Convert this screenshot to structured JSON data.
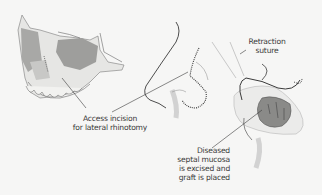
{
  "figure": {
    "panels": [
      {
        "id": "skull",
        "description": "Skull with lateral rhinotomy incision site"
      },
      {
        "id": "nose-incision",
        "description": "Nose profile with dotted access incision line"
      },
      {
        "id": "nose-opened",
        "description": "Nose retracted with septal mucosa exposed"
      }
    ],
    "labels": {
      "access_line1": "Access incision",
      "access_line2": "for lateral rhinotomy",
      "retraction_line1": "Retraction",
      "retraction_line2": "suture",
      "diseased_line1": "Diseased",
      "diseased_line2": "septal mucosa",
      "diseased_line3": "is excised and",
      "diseased_line4": "graft is placed"
    },
    "colors": {
      "background": "#f6f6f5",
      "bone": "#e8e8e6",
      "bone_shadow": "#9c9c9c",
      "outline": "#3a3a3a",
      "mucosa": "#8a8a88"
    }
  }
}
